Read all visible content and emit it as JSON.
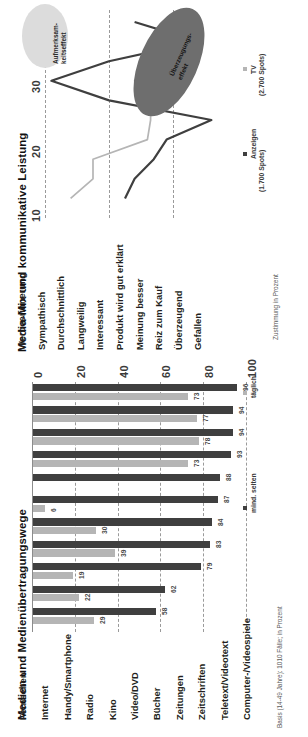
{
  "document": {
    "kind": "two-chart-figure",
    "orientation": "rotated-90-ccw"
  },
  "colors": {
    "dark_series": "#3f3f3f",
    "light_series": "#b5b5b5",
    "grid": "#9a9a9a",
    "annotation_light_fill": "#d9d9d9",
    "annotation_dark_fill": "#6e6e6e",
    "text": "#231f20"
  },
  "line_chart": {
    "title": "Media-Mix und kommunikative Leistung",
    "axis_note": "Zustimmung in Prozent",
    "legend": [
      {
        "label": "TV",
        "sub": "(2.700 Spots)",
        "color": "#b5b5b5"
      },
      {
        "label": "Anzeigen",
        "sub": "(1.700 Spots)",
        "color": "#3f3f3f"
      }
    ],
    "annotations": [
      {
        "text": "Aufmerksam-\nkeitseffekt",
        "line1": "Aufmerksam-",
        "line2": "keitseffekt",
        "style": "light"
      },
      {
        "text": "Überzeugungs-\neffekt",
        "line1": "Überzeugungs-",
        "line2": "effekt",
        "style": "dark"
      }
    ],
    "yticks": [
      "10",
      "20",
      "30"
    ]
  },
  "bar_chart": {
    "title": "Medien und Medienübertragungswege",
    "footnote": "Basis (14-49 Jahre): 1010 Fälle; in Prozent",
    "legend": [
      {
        "label": "mind. selten",
        "color": "#3f3f3f"
      },
      {
        "label": "täglich",
        "color": "#b5b5b5"
      }
    ],
    "xticks": [
      "0",
      "20",
      "40",
      "60",
      "80",
      "100"
    ]
  },
  "chart_data": [
    {
      "type": "line",
      "title": "Media-Mix und kommunikative Leistung",
      "xlabel": "",
      "ylabel": "Zustimmung in Prozent",
      "ylim": [
        5,
        37
      ],
      "yticks": [
        10,
        20,
        30
      ],
      "grid": true,
      "legend_position": "right",
      "categories": [
        "Werbeerinnerung",
        "Sympathisch",
        "Durchschnittlich",
        "Langweilig",
        "Interessant",
        "Produkt wird gut erklärt",
        "Meinung besser",
        "Reiz zum Kauf",
        "Überzeugend",
        "Gefallen"
      ],
      "series": [
        {
          "name": "Anzeigen (1.700 Spots)",
          "color": "#3f3f3f",
          "values": [
            24,
            34,
            20,
            11,
            20,
            36,
            29,
            27,
            24,
            22.5
          ]
        },
        {
          "name": "TV (2.700 Spots)",
          "color": "#b5b5b5",
          "values": [
            34,
            34,
            30,
            24,
            26.5,
            26.5,
            26,
            17.5,
            17.5,
            14
          ]
        }
      ],
      "annotations": [
        {
          "text": "Aufmerksamkeitseffekt",
          "near_categories": [
            "Werbeerinnerung",
            "Sympathisch"
          ]
        },
        {
          "text": "Überzeugungseffekt",
          "near_categories": [
            "Produkt wird gut erklärt",
            "Meinung besser",
            "Reiz zum Kauf",
            "Überzeugend"
          ]
        }
      ]
    },
    {
      "type": "bar",
      "title": "Medien und Medienübertragungswege",
      "xlabel": "",
      "ylabel": "",
      "ylim": [
        0,
        100
      ],
      "yticks": [
        0,
        20,
        40,
        60,
        80,
        100
      ],
      "grid": true,
      "legend_position": "right",
      "footnote": "Basis (14-49 Jahre): 1010 Fälle; in Prozent",
      "categories": [
        "Fernsehen",
        "Internet",
        "Handy/Smartphone",
        "Radio",
        "Kino",
        "Video/DVD",
        "Bücher",
        "Zeitungen",
        "Zeitschriften",
        "Teletext/Videotext",
        "Computer-/Videospiele"
      ],
      "series": [
        {
          "name": "mind. selten",
          "color": "#3f3f3f",
          "values": [
            96,
            94,
            94,
            93,
            88,
            87,
            84,
            83,
            79,
            62,
            58
          ]
        },
        {
          "name": "täglich",
          "color": "#b5b5b5",
          "values": [
            73,
            77,
            78,
            73,
            null,
            6,
            30,
            39,
            19,
            22,
            29
          ]
        }
      ]
    }
  ]
}
